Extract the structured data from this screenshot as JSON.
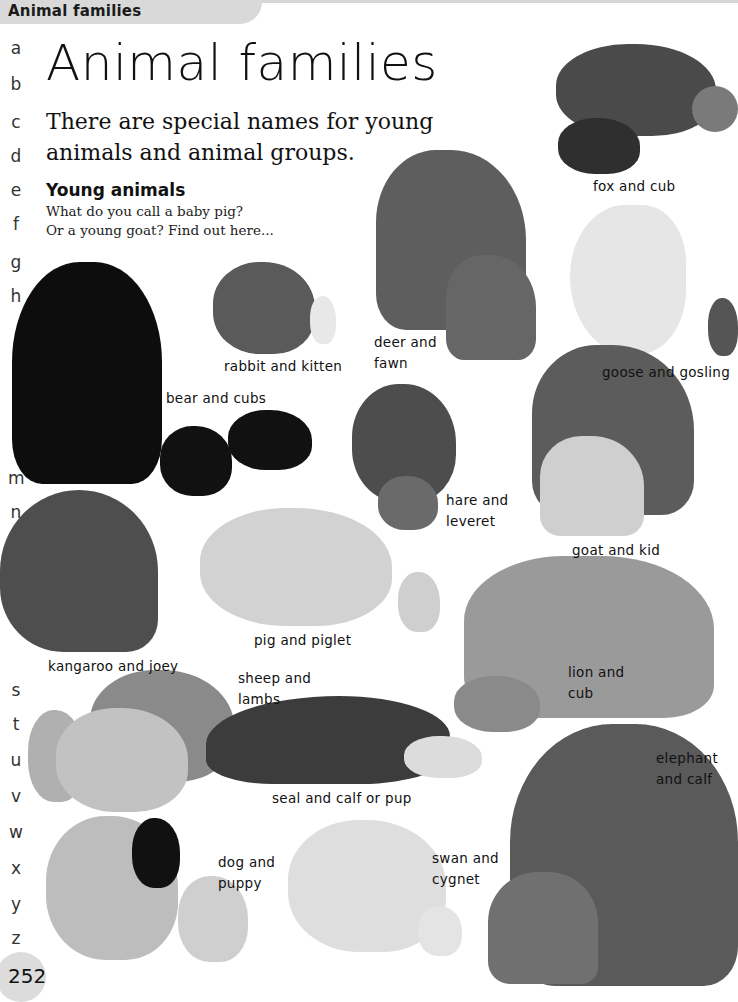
{
  "header": {
    "tab_label": "Animal families"
  },
  "page": {
    "title": "Animal families",
    "intro": "There are special names for young animals and animal groups.",
    "section_heading": "Young animals",
    "section_text_line1": "What do you call a baby pig?",
    "section_text_line2": "Or a young goat? Find out here...",
    "page_number": "252"
  },
  "alphabet_index": [
    "a",
    "b",
    "c",
    "d",
    "e",
    "f",
    "g",
    "h",
    "m",
    "n",
    "o",
    "p",
    "s",
    "t",
    "u",
    "v",
    "w",
    "x",
    "y",
    "z"
  ],
  "animals": [
    {
      "id": "fox",
      "label_line1": "fox and cub",
      "label_line2": ""
    },
    {
      "id": "deer",
      "label_line1": "deer and",
      "label_line2": "fawn"
    },
    {
      "id": "goose",
      "label_line1": "goose and gosling",
      "label_line2": ""
    },
    {
      "id": "rabbit",
      "label_line1": "rabbit and kitten",
      "label_line2": ""
    },
    {
      "id": "bear",
      "label_line1": "bear and cubs",
      "label_line2": ""
    },
    {
      "id": "hare",
      "label_line1": "hare and",
      "label_line2": "leveret"
    },
    {
      "id": "goat",
      "label_line1": "goat and kid",
      "label_line2": ""
    },
    {
      "id": "pig",
      "label_line1": "pig and piglet",
      "label_line2": ""
    },
    {
      "id": "kangaroo",
      "label_line1": "kangaroo and joey",
      "label_line2": ""
    },
    {
      "id": "lion",
      "label_line1": "lion and",
      "label_line2": "cub"
    },
    {
      "id": "sheep",
      "label_line1": "sheep and",
      "label_line2": "lambs"
    },
    {
      "id": "seal",
      "label_line1": "seal and calf or pup",
      "label_line2": ""
    },
    {
      "id": "elephant",
      "label_line1": "elephant",
      "label_line2": "and calf"
    },
    {
      "id": "dog",
      "label_line1": "dog and",
      "label_line2": "puppy"
    },
    {
      "id": "swan",
      "label_line1": "swan and",
      "label_line2": "cygnet"
    }
  ],
  "colors": {
    "tab_bg": "#d9d9d9",
    "page_bg": "#ffffff",
    "text": "#111111",
    "page_number_bg": "#dcdcdc"
  }
}
